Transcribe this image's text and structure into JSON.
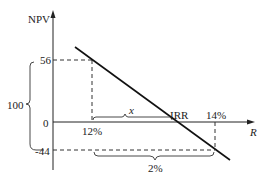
{
  "diagram": {
    "y_axis_label": "NPV",
    "x_axis_label": "R",
    "y_ticks": {
      "top": "56",
      "zero": "0",
      "bottom": "-44"
    },
    "x_ticks": {
      "left": "12%",
      "right": "14%"
    },
    "irr_label": "IRR",
    "x_brace_label": "x",
    "bottom_brace_label": "2%",
    "left_brace_label": "100",
    "colors": {
      "line": "#111111",
      "axis": "#222222",
      "dashed": "#333333"
    }
  }
}
